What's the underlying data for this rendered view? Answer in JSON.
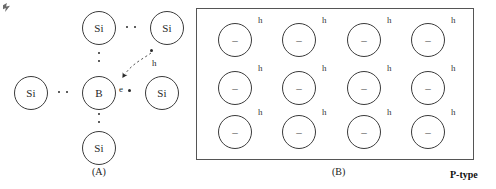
{
  "figure": {
    "kind": "semiconductor-doping-diagram",
    "panels": [
      {
        "id": "A",
        "caption": "(A)",
        "atoms": [
          {
            "label": "Si",
            "x": 14,
            "y": 76,
            "name": "atom-si-left"
          },
          {
            "label": "Si",
            "x": 82,
            "y": 11,
            "name": "atom-si-top"
          },
          {
            "label": "Si",
            "x": 150,
            "y": 11,
            "name": "atom-si-top-right"
          },
          {
            "label": "B",
            "x": 82,
            "y": 76,
            "name": "atom-boron-center"
          },
          {
            "label": "Si",
            "x": 145,
            "y": 76,
            "name": "atom-si-right"
          },
          {
            "label": "Si",
            "x": 82,
            "y": 131,
            "name": "atom-si-bottom"
          }
        ],
        "bond_dots": [
          {
            "orientation": "horizontal",
            "x": 58,
            "y": 91,
            "count": 2,
            "name": "bond-dots-left"
          },
          {
            "orientation": "horizontal",
            "x": 126,
            "y": 26,
            "count": 2,
            "name": "bond-dots-top"
          },
          {
            "orientation": "vertical",
            "x": 98,
            "y": 52,
            "count": 2,
            "name": "bond-dots-upper"
          },
          {
            "orientation": "vertical",
            "x": 98,
            "y": 113,
            "count": 2,
            "name": "bond-dots-lower"
          }
        ],
        "hole": {
          "label": "h",
          "label_x": 155,
          "label_y": 62,
          "dot_x": 152,
          "dot_y": 50,
          "name": "hole-marker"
        },
        "electron": {
          "label": "e",
          "label_x": 121,
          "label_y": 86,
          "dot_x": 131,
          "dot_y": 89,
          "name": "electron-marker"
        },
        "arrow": {
          "path": "M 152,53 C 140,60 128,66 121,78",
          "name": "electron-transition-arrow",
          "style": "dashed-curved"
        }
      },
      {
        "id": "B",
        "caption": "(B)",
        "material_label": "P-type",
        "rows": 3,
        "cols": 4,
        "cell": {
          "charge": "–",
          "hole_label": "h"
        },
        "grid": [
          [
            {
              "charge": "–",
              "hole": "h"
            },
            {
              "charge": "–",
              "hole": "h"
            },
            {
              "charge": "–",
              "hole": "h"
            },
            {
              "charge": "–",
              "hole": "h"
            }
          ],
          [
            {
              "charge": "–",
              "hole": "h"
            },
            {
              "charge": "–",
              "hole": "h"
            },
            {
              "charge": "–",
              "hole": "h"
            },
            {
              "charge": "–",
              "hole": "h"
            }
          ],
          [
            {
              "charge": "–",
              "hole": "h"
            },
            {
              "charge": "–",
              "hole": "h"
            },
            {
              "charge": "–",
              "hole": "h"
            },
            {
              "charge": "–",
              "hole": "h"
            }
          ]
        ]
      }
    ],
    "colors": {
      "stroke": "#3b3b3b",
      "box_stroke": "#555555",
      "text": "#1a1a1a",
      "background": "#ffffff"
    }
  }
}
